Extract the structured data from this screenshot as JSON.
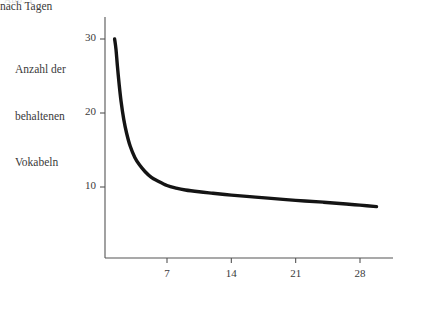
{
  "figure": {
    "background_color": "#ffffff",
    "ink_color": "#141414",
    "axis_color": "#555555",
    "text_color": "#3a3a3a",
    "top_caption_ghost": "Abb. 1"
  },
  "chart_data": {
    "type": "line",
    "title": "",
    "subtitle": "",
    "xlabel": "nach Tagen",
    "ylabel": "Anzahl der behaltenen Vokabeln",
    "ylabel_lines": [
      "Anzahl der",
      "behaltenen",
      "Vokabeln"
    ],
    "xlim": [
      0,
      31.5
    ],
    "ylim": [
      0,
      32.6
    ],
    "xticks": [
      7,
      14,
      21,
      28
    ],
    "xtick_labels": [
      "7",
      "14",
      "21",
      "28"
    ],
    "yticks": [
      10,
      20,
      30
    ],
    "ytick_labels": [
      "10",
      "20",
      "30"
    ],
    "grid": false,
    "legend": null,
    "legend_position": "none",
    "annotations": [],
    "series": [
      {
        "name": "behaltene Vokabeln",
        "color": "#141414",
        "line_width": 3.4,
        "x": [
          1.3,
          1.45,
          1.6,
          1.8,
          2.0,
          2.3,
          2.6,
          3.0,
          3.5,
          4.0,
          4.6,
          5.3,
          6.0,
          7.0,
          8.0,
          9.0,
          10.5,
          12.0,
          14.0,
          16.0,
          18.0,
          21.0,
          24.0,
          26.5,
          28.0,
          29.8
        ],
        "y": [
          30.0,
          28.6,
          26.4,
          23.8,
          21.6,
          19.1,
          17.3,
          15.5,
          14.0,
          13.0,
          12.1,
          11.3,
          10.8,
          10.2,
          9.85,
          9.6,
          9.35,
          9.15,
          8.9,
          8.7,
          8.5,
          8.2,
          7.95,
          7.7,
          7.55,
          7.35
        ]
      }
    ]
  },
  "geometry": {
    "plot_left_px": 105,
    "plot_right_px": 393,
    "plot_top_px": 17,
    "plot_bottom_px": 258,
    "x_px_per_day": 9.24,
    "y_px_per_unit": 7.4,
    "y_value_30_px": 39,
    "y_value_20_px": 113,
    "y_value_10_px": 187,
    "x_value_7_px": 167,
    "x_value_14_px": 231,
    "x_value_21_px": 296,
    "x_value_28_px": 360,
    "tick_length_px": 5
  }
}
